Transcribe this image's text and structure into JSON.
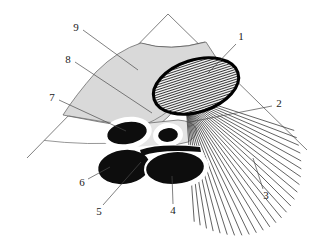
{
  "figure": {
    "background_color": "#ffffff",
    "width": 326,
    "height": 244
  },
  "palette": {
    "tissue_gray": "#d9d9d9",
    "tissue_light_gray": "#e4e4e4",
    "blob_black": "#0d0d0d",
    "outline_black": "#000000",
    "line_gray": "#4a4a4a",
    "label_color": "#1a1a1a",
    "halo_white": "#ffffff"
  },
  "scan_cone": {
    "apex": {
      "x": 168,
      "y": 14
    },
    "left_edge_end": {
      "x": 27,
      "y": 158
    },
    "right_edge_end": {
      "x": 307,
      "y": 150
    },
    "near_field_arc_y": 42
  },
  "reference_labels": [
    {
      "id": "1",
      "text": "1",
      "x": 241,
      "y": 37,
      "leader": [
        [
          236,
          44
        ],
        [
          208,
          73
        ]
      ],
      "points_to": "hatched-oval-structure"
    },
    {
      "id": "2",
      "text": "2",
      "x": 279,
      "y": 104,
      "leader": [
        [
          272,
          106
        ],
        [
          190,
          122
        ]
      ],
      "points_to": "ray-fan-origin"
    },
    {
      "id": "3",
      "text": "3",
      "x": 266,
      "y": 196,
      "leader": [
        [
          263,
          189
        ],
        [
          253,
          158
        ]
      ],
      "points_to": "ray-fan-field"
    },
    {
      "id": "4",
      "text": "4",
      "x": 173,
      "y": 211,
      "leader": [
        [
          173,
          204
        ],
        [
          172,
          176
        ]
      ],
      "points_to": "lower-right-black-ellipse"
    },
    {
      "id": "5",
      "text": "5",
      "x": 99,
      "y": 212,
      "leader": [
        [
          103,
          205
        ],
        [
          141,
          162
        ]
      ],
      "points_to": "lower-left-black-ellipse-upper"
    },
    {
      "id": "6",
      "text": "6",
      "x": 82,
      "y": 183,
      "leader": [
        [
          88,
          179
        ],
        [
          110,
          167
        ]
      ],
      "points_to": "lower-left-black-ellipse"
    },
    {
      "id": "7",
      "text": "7",
      "x": 52,
      "y": 98,
      "leader": [
        [
          59,
          100
        ],
        [
          126,
          131
        ]
      ],
      "points_to": "upper-black-ellipse"
    },
    {
      "id": "8",
      "text": "8",
      "x": 68,
      "y": 60,
      "leader": [
        [
          75,
          62
        ],
        [
          152,
          113
        ]
      ],
      "points_to": "light-gray-lobe"
    },
    {
      "id": "9",
      "text": "9",
      "x": 76,
      "y": 28,
      "leader": [
        [
          83,
          30
        ],
        [
          138,
          70
        ]
      ],
      "points_to": "tissue-sector-region"
    }
  ],
  "structures": {
    "hatched_oval": {
      "name": "hatched-oval-structure",
      "center": {
        "x": 196,
        "y": 86
      },
      "rx": 44,
      "ry": 26,
      "rotation": -18,
      "hatch_style": "horizontal-lines",
      "hatch_count": 22,
      "outline_weight": 3.1
    },
    "ray_fan": {
      "name": "ray-fan",
      "origin": {
        "x": 188,
        "y": 110
      },
      "ray_count": 26,
      "angle_start_deg": 18,
      "angle_end_deg": 86
    },
    "black_ellipses": [
      {
        "name": "upper-black-ellipse",
        "cx": 127,
        "cy": 133,
        "rx": 21,
        "ry": 12,
        "rot": -10
      },
      {
        "name": "small-black-circle",
        "cx": 168,
        "cy": 135,
        "rx": 11,
        "ry": 8,
        "rot": -6
      },
      {
        "name": "lower-left-black-ellipse",
        "cx": 124,
        "cy": 167,
        "rx": 27,
        "ry": 18,
        "rot": -8
      },
      {
        "name": "lower-right-black-ellipse",
        "cx": 175,
        "cy": 168,
        "rx": 30,
        "ry": 17,
        "rot": -4
      }
    ]
  }
}
